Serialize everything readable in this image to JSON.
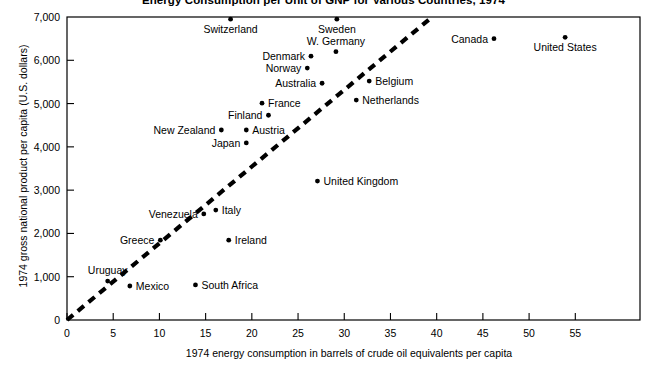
{
  "chart_data": {
    "type": "scatter",
    "title": "Energy Consumption per Unit of GNP for Various Countries, 1974",
    "xlabel": "1974 energy consumption in barrels of crude oil equivalents per capita",
    "ylabel": "1974 gross national product per capita (U.S. dollars)",
    "xlim": [
      0,
      62
    ],
    "ylim": [
      0,
      7000
    ],
    "xticks": [
      0,
      5,
      10,
      15,
      20,
      25,
      30,
      35,
      40,
      45,
      50,
      55
    ],
    "xtick_labels": [
      "0",
      "5",
      "10",
      "15",
      "20",
      "25",
      "30",
      "35",
      "40",
      "45",
      "50",
      "55"
    ],
    "yticks": [
      0,
      1000,
      2000,
      3000,
      4000,
      5000,
      6000,
      7000
    ],
    "ytick_labels": [
      "0",
      "1,000",
      "2,000",
      "3,000",
      "4,000",
      "5,000",
      "6,000",
      "7,000"
    ],
    "grid": false,
    "legend": "none",
    "marker_color": "#000000",
    "line_color": "#000000",
    "trend_line": {
      "style": "dashed",
      "x": [
        0,
        39.5
      ],
      "y": [
        0,
        7000
      ]
    },
    "points": [
      {
        "name": "Switzerland",
        "x": 17.7,
        "y": 6950,
        "label_pos": "below"
      },
      {
        "name": "Sweden",
        "x": 29.2,
        "y": 6950,
        "label_pos": "below"
      },
      {
        "name": "Canada",
        "x": 46.2,
        "y": 6500,
        "label_pos": "left"
      },
      {
        "name": "United States",
        "x": 53.9,
        "y": 6530,
        "label_pos": "below"
      },
      {
        "name": "W. Germany",
        "x": 29.1,
        "y": 6200,
        "label_pos": "above"
      },
      {
        "name": "Denmark",
        "x": 26.4,
        "y": 6095,
        "label_pos": "left"
      },
      {
        "name": "Norway",
        "x": 26.0,
        "y": 5820,
        "label_pos": "left"
      },
      {
        "name": "Australia",
        "x": 27.6,
        "y": 5470,
        "label_pos": "left"
      },
      {
        "name": "Belgium",
        "x": 32.7,
        "y": 5520,
        "label_pos": "right"
      },
      {
        "name": "Netherlands",
        "x": 31.3,
        "y": 5080,
        "label_pos": "right"
      },
      {
        "name": "France",
        "x": 21.1,
        "y": 5010,
        "label_pos": "right"
      },
      {
        "name": "Finland",
        "x": 21.8,
        "y": 4730,
        "label_pos": "left"
      },
      {
        "name": "New Zealand",
        "x": 16.7,
        "y": 4390,
        "label_pos": "left"
      },
      {
        "name": "Austria",
        "x": 19.4,
        "y": 4390,
        "label_pos": "right"
      },
      {
        "name": "Japan",
        "x": 19.4,
        "y": 4090,
        "label_pos": "left"
      },
      {
        "name": "United Kingdom",
        "x": 27.1,
        "y": 3210,
        "label_pos": "right"
      },
      {
        "name": "Italy",
        "x": 16.1,
        "y": 2540,
        "label_pos": "right"
      },
      {
        "name": "Venezuela",
        "x": 14.8,
        "y": 2450,
        "label_pos": "left"
      },
      {
        "name": "Ireland",
        "x": 17.5,
        "y": 1845,
        "label_pos": "right"
      },
      {
        "name": "Greece",
        "x": 10.1,
        "y": 1845,
        "label_pos": "left"
      },
      {
        "name": "Mexico",
        "x": 6.8,
        "y": 785,
        "label_pos": "right"
      },
      {
        "name": "Uruguay",
        "x": 4.4,
        "y": 900,
        "label_pos": "above"
      },
      {
        "name": "South Africa",
        "x": 13.9,
        "y": 810,
        "label_pos": "right"
      }
    ]
  }
}
